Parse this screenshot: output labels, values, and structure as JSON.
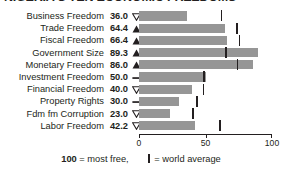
{
  "chart_data": {
    "type": "bar",
    "title": "NIGERIA'S TEN ECONOMIC FREEDOMS",
    "orientation": "horizontal",
    "xlabel": "",
    "ylabel": "",
    "xlim": [
      0,
      100
    ],
    "grid": false,
    "legend_position": "bottom",
    "categories": [
      "Business Freedom",
      "Trade Freedom",
      "Fiscal Freedom",
      "Government Size",
      "Monetary Freedom",
      "Investment Freedom",
      "Financial Freedom",
      "Property Rights",
      "Fdm fm Corruption",
      "Labor Freedom"
    ],
    "values": [
      36.0,
      64.4,
      66.4,
      89.3,
      86.0,
      50.0,
      40.0,
      30.0,
      23.0,
      42.2
    ],
    "value_labels": [
      "36.0",
      "64.4",
      "66.4",
      "89.3",
      "86.0",
      "50.0",
      "40.0",
      "30.0",
      "23.0",
      "42.2"
    ],
    "trend_indicators": [
      "down",
      "up",
      "up",
      "up",
      "up",
      "flat",
      "down",
      "flat",
      "down",
      "down"
    ],
    "world_average": [
      62.0,
      73.6,
      75.5,
      65.3,
      74.0,
      49.0,
      48.5,
      43.6,
      40.5,
      61.0
    ],
    "series": [
      {
        "name": "Country score",
        "values": [
          36.0,
          64.4,
          66.4,
          89.3,
          86.0,
          50.0,
          40.0,
          30.0,
          23.0,
          42.2
        ],
        "color": "#969696"
      },
      {
        "name": "world average",
        "marker": "vertical-bar",
        "values": [
          62.0,
          73.6,
          75.5,
          65.3,
          74.0,
          49.0,
          48.5,
          43.6,
          40.5,
          61.0
        ],
        "color": "#231f20"
      }
    ],
    "xticks": [
      0,
      50,
      100
    ],
    "xtick_labels": [
      "0",
      "50",
      "100"
    ],
    "footnote_value": "100",
    "footnote_text": "= most free,",
    "legend_text": "= world average",
    "colors": {
      "bar": "#969696",
      "average_marker": "#231f20",
      "text": "#231f20",
      "background": "#ffffff"
    }
  }
}
